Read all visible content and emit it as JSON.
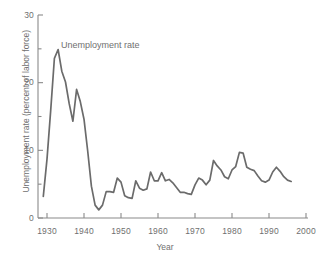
{
  "chart_data": {
    "type": "line",
    "title": "",
    "xlabel": "Year",
    "ylabel": "Unemployment rate (percent of labor force)",
    "xlim": [
      1929,
      2000
    ],
    "ylim": [
      0,
      30
    ],
    "xticks": [
      1930,
      1940,
      1950,
      1960,
      1970,
      1980,
      1990,
      2000
    ],
    "xtick_labels": [
      "1930",
      "1940",
      "1950",
      "1960",
      "1970",
      "1980",
      "1990",
      "2000"
    ],
    "yticks": [
      0,
      10,
      20,
      30
    ],
    "ytick_labels": [
      "0",
      "10",
      "20",
      "30"
    ],
    "yminorticks": [
      5,
      15,
      25
    ],
    "grid": false,
    "legend_position": "inline-annotation",
    "annotations": [
      {
        "text": "Unemployment rate",
        "x": 1938,
        "y": 26
      }
    ],
    "line_color": "#6b6b6b",
    "axis_color": "#8a8a8a",
    "series": [
      {
        "name": "Unemployment rate",
        "x": [
          1929,
          1930,
          1931,
          1932,
          1933,
          1934,
          1935,
          1936,
          1937,
          1938,
          1939,
          1940,
          1941,
          1942,
          1943,
          1944,
          1945,
          1946,
          1947,
          1948,
          1949,
          1950,
          1951,
          1952,
          1953,
          1954,
          1955,
          1956,
          1957,
          1958,
          1959,
          1960,
          1961,
          1962,
          1963,
          1964,
          1965,
          1966,
          1967,
          1968,
          1969,
          1970,
          1971,
          1972,
          1973,
          1974,
          1975,
          1976,
          1977,
          1978,
          1979,
          1980,
          1981,
          1982,
          1983,
          1984,
          1985,
          1986,
          1987,
          1988,
          1989,
          1990,
          1991,
          1992,
          1993,
          1994,
          1995,
          1996
        ],
        "values": [
          3.2,
          8.7,
          15.9,
          23.6,
          24.9,
          21.7,
          20.1,
          16.9,
          14.3,
          19.0,
          17.2,
          14.6,
          9.9,
          4.7,
          1.9,
          1.2,
          1.9,
          3.9,
          3.9,
          3.8,
          5.9,
          5.3,
          3.3,
          3.0,
          2.9,
          5.5,
          4.4,
          4.1,
          4.3,
          6.8,
          5.5,
          5.5,
          6.7,
          5.5,
          5.7,
          5.2,
          4.5,
          3.8,
          3.8,
          3.6,
          3.5,
          4.9,
          5.9,
          5.6,
          4.9,
          5.6,
          8.5,
          7.7,
          7.1,
          6.1,
          5.8,
          7.1,
          7.6,
          9.7,
          9.6,
          7.5,
          7.2,
          7.0,
          6.2,
          5.5,
          5.3,
          5.6,
          6.8,
          7.5,
          6.9,
          6.1,
          5.6,
          5.4
        ]
      }
    ]
  },
  "axes": {
    "y_title": "Unemployment rate (percent of labor force)",
    "x_title": "Year"
  }
}
